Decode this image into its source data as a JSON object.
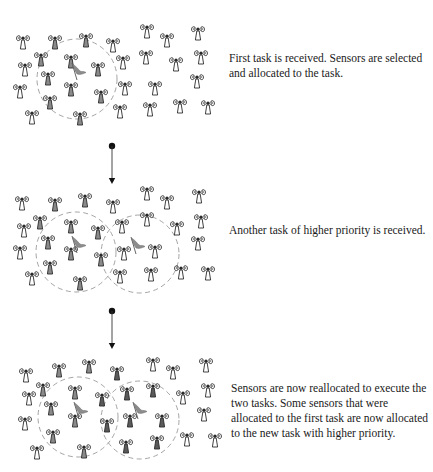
{
  "colors": {
    "outline": "#2a2a2a",
    "allocated_fill": "#8a8a8a",
    "allocated_fill_new": "#5a5a5a",
    "free_fill": "#ffffff",
    "circle": "#9a9a9a",
    "flag": "#8c8c8c",
    "arrow": "#111111",
    "text": "#1a1a1a"
  },
  "panels": [
    {
      "id": "panel-1",
      "caption": "First task is received. Sensors are selected and allocated to the task.",
      "circles": [
        {
          "cx": 77,
          "cy": 79,
          "r": 40
        }
      ],
      "flags": [
        {
          "x": 72,
          "y": 63
        }
      ],
      "sensors": [
        {
          "x": 23,
          "y": 42,
          "s": "free"
        },
        {
          "x": 55,
          "y": 42,
          "s": "a1"
        },
        {
          "x": 86,
          "y": 40,
          "s": "a1"
        },
        {
          "x": 113,
          "y": 45,
          "s": "free"
        },
        {
          "x": 41,
          "y": 59,
          "s": "a1"
        },
        {
          "x": 71,
          "y": 61,
          "s": "a1"
        },
        {
          "x": 25,
          "y": 69,
          "s": "free"
        },
        {
          "x": 123,
          "y": 62,
          "s": "free"
        },
        {
          "x": 98,
          "y": 69,
          "s": "a1"
        },
        {
          "x": 48,
          "y": 78,
          "s": "a1"
        },
        {
          "x": 20,
          "y": 91,
          "s": "free"
        },
        {
          "x": 71,
          "y": 89,
          "s": "a1"
        },
        {
          "x": 125,
          "y": 88,
          "s": "free"
        },
        {
          "x": 101,
          "y": 96,
          "s": "a1"
        },
        {
          "x": 50,
          "y": 102,
          "s": "a1"
        },
        {
          "x": 32,
          "y": 117,
          "s": "free"
        },
        {
          "x": 80,
          "y": 118,
          "s": "a1"
        },
        {
          "x": 120,
          "y": 111,
          "s": "free"
        },
        {
          "x": 147,
          "y": 31,
          "s": "free"
        },
        {
          "x": 167,
          "y": 40,
          "s": "free"
        },
        {
          "x": 198,
          "y": 33,
          "s": "free"
        },
        {
          "x": 146,
          "y": 57,
          "s": "free"
        },
        {
          "x": 176,
          "y": 64,
          "s": "free"
        },
        {
          "x": 201,
          "y": 57,
          "s": "free"
        },
        {
          "x": 197,
          "y": 81,
          "s": "free"
        },
        {
          "x": 155,
          "y": 88,
          "s": "free"
        },
        {
          "x": 150,
          "y": 109,
          "s": "free"
        },
        {
          "x": 180,
          "y": 106,
          "s": "free"
        },
        {
          "x": 208,
          "y": 107,
          "s": "free"
        }
      ]
    },
    {
      "id": "panel-2",
      "caption": "Another task of higher priority is received.",
      "circles": [
        {
          "cx": 76,
          "cy": 252,
          "r": 40
        },
        {
          "cx": 140,
          "cy": 254,
          "r": 39
        }
      ],
      "flags": [
        {
          "x": 72,
          "y": 236
        },
        {
          "x": 131,
          "y": 237
        }
      ],
      "sensors": [
        {
          "x": 22,
          "y": 203,
          "s": "free"
        },
        {
          "x": 55,
          "y": 204,
          "s": "a1"
        },
        {
          "x": 85,
          "y": 200,
          "s": "a1"
        },
        {
          "x": 113,
          "y": 206,
          "s": "free"
        },
        {
          "x": 40,
          "y": 222,
          "s": "a1"
        },
        {
          "x": 71,
          "y": 226,
          "s": "a1"
        },
        {
          "x": 24,
          "y": 230,
          "s": "free"
        },
        {
          "x": 122,
          "y": 226,
          "s": "free"
        },
        {
          "x": 98,
          "y": 232,
          "s": "a1"
        },
        {
          "x": 48,
          "y": 242,
          "s": "a1"
        },
        {
          "x": 20,
          "y": 252,
          "s": "free"
        },
        {
          "x": 71,
          "y": 253,
          "s": "a1"
        },
        {
          "x": 124,
          "y": 253,
          "s": "free"
        },
        {
          "x": 101,
          "y": 259,
          "s": "a1"
        },
        {
          "x": 50,
          "y": 267,
          "s": "a1"
        },
        {
          "x": 32,
          "y": 278,
          "s": "free"
        },
        {
          "x": 80,
          "y": 283,
          "s": "a1"
        },
        {
          "x": 120,
          "y": 276,
          "s": "free"
        },
        {
          "x": 147,
          "y": 193,
          "s": "free"
        },
        {
          "x": 167,
          "y": 202,
          "s": "free"
        },
        {
          "x": 199,
          "y": 196,
          "s": "free"
        },
        {
          "x": 147,
          "y": 219,
          "s": "free"
        },
        {
          "x": 177,
          "y": 228,
          "s": "free"
        },
        {
          "x": 201,
          "y": 221,
          "s": "free"
        },
        {
          "x": 198,
          "y": 243,
          "s": "free"
        },
        {
          "x": 155,
          "y": 251,
          "s": "free"
        },
        {
          "x": 151,
          "y": 274,
          "s": "free"
        },
        {
          "x": 181,
          "y": 272,
          "s": "free"
        },
        {
          "x": 208,
          "y": 273,
          "s": "free"
        }
      ]
    },
    {
      "id": "panel-3",
      "caption": "Sensors are now reallocated to execute the two tasks. Some sensors that were allocated to the first task are now allocated to the new task with higher priority.",
      "circles": [
        {
          "cx": 78,
          "cy": 417,
          "r": 40
        },
        {
          "cx": 140,
          "cy": 420,
          "r": 39
        }
      ],
      "flags": [
        {
          "x": 74,
          "y": 402
        },
        {
          "x": 133,
          "y": 402
        }
      ],
      "sensors": [
        {
          "x": 26,
          "y": 375,
          "s": "free"
        },
        {
          "x": 59,
          "y": 370,
          "s": "a1"
        },
        {
          "x": 89,
          "y": 366,
          "s": "a1"
        },
        {
          "x": 117,
          "y": 373,
          "s": "a2"
        },
        {
          "x": 43,
          "y": 389,
          "s": "a1"
        },
        {
          "x": 75,
          "y": 392,
          "s": "a1"
        },
        {
          "x": 29,
          "y": 398,
          "s": "free"
        },
        {
          "x": 127,
          "y": 393,
          "s": "a2"
        },
        {
          "x": 102,
          "y": 399,
          "s": "a2"
        },
        {
          "x": 51,
          "y": 408,
          "s": "a1"
        },
        {
          "x": 25,
          "y": 423,
          "s": "free"
        },
        {
          "x": 75,
          "y": 420,
          "s": "a1"
        },
        {
          "x": 130,
          "y": 420,
          "s": "a2"
        },
        {
          "x": 107,
          "y": 425,
          "s": "a2"
        },
        {
          "x": 53,
          "y": 436,
          "s": "a1"
        },
        {
          "x": 37,
          "y": 452,
          "s": "free"
        },
        {
          "x": 84,
          "y": 451,
          "s": "a1"
        },
        {
          "x": 126,
          "y": 446,
          "s": "a2"
        },
        {
          "x": 153,
          "y": 364,
          "s": "free"
        },
        {
          "x": 173,
          "y": 372,
          "s": "free"
        },
        {
          "x": 206,
          "y": 365,
          "s": "free"
        },
        {
          "x": 153,
          "y": 390,
          "s": "a2"
        },
        {
          "x": 183,
          "y": 397,
          "s": "free"
        },
        {
          "x": 208,
          "y": 390,
          "s": "free"
        },
        {
          "x": 204,
          "y": 414,
          "s": "free"
        },
        {
          "x": 162,
          "y": 420,
          "s": "a2"
        },
        {
          "x": 157,
          "y": 442,
          "s": "a2"
        },
        {
          "x": 187,
          "y": 439,
          "s": "free"
        },
        {
          "x": 215,
          "y": 440,
          "s": "free"
        }
      ]
    }
  ],
  "arrows": [
    {
      "x": 112,
      "y1": 146,
      "y2": 184
    },
    {
      "x": 112,
      "y1": 311,
      "y2": 349
    }
  ]
}
